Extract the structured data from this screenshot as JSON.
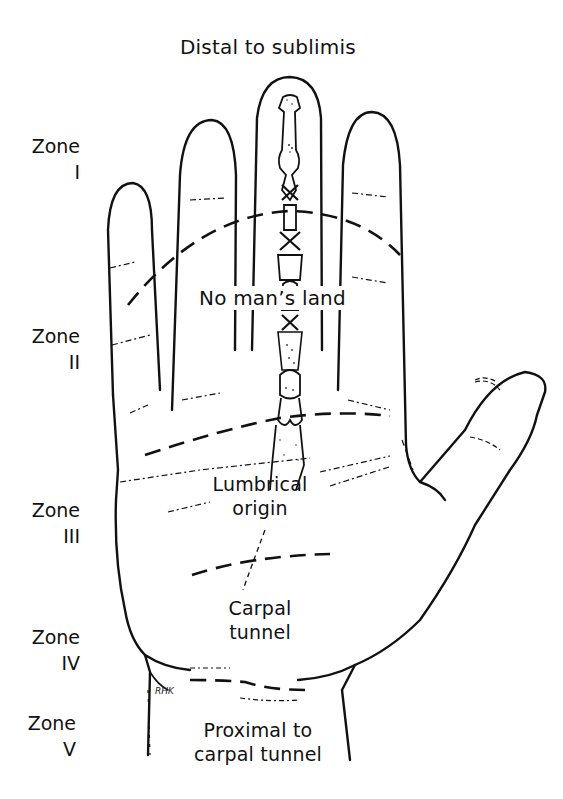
{
  "title": "Distal to sublimis",
  "zones": [
    {
      "name": "Zone",
      "numeral": "I"
    },
    {
      "name": "Zone",
      "numeral": "II"
    },
    {
      "name": "Zone",
      "numeral": "III"
    },
    {
      "name": "Zone",
      "numeral": "IV"
    },
    {
      "name": "Zone",
      "numeral": "V"
    }
  ],
  "region_labels": {
    "no_mans_land": "No man’s land",
    "lumbrical_line1": "Lumbrical",
    "lumbrical_line2": "origin",
    "carpal_line1": "Carpal",
    "carpal_line2": "tunnel",
    "proximal_line1": "Proximal to",
    "proximal_line2": "carpal tunnel"
  },
  "signature": "RHK",
  "colors": {
    "line": "#111111",
    "background": "#ffffff"
  }
}
